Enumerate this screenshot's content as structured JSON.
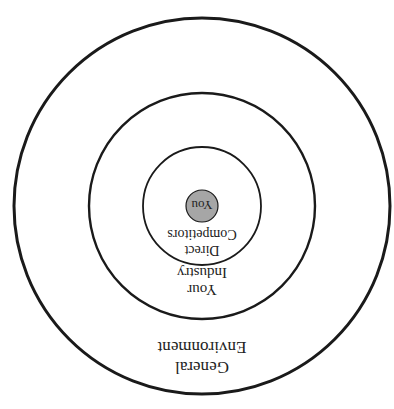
{
  "diagram": {
    "type": "concentric-circles",
    "orientation": "rotated-180",
    "rings": [
      {
        "id": "outer",
        "label_lines": [
          "General",
          "Environment"
        ]
      },
      {
        "id": "middle",
        "label_lines": [
          "Your",
          "Industry"
        ]
      },
      {
        "id": "inner",
        "label_lines": [
          "Direct",
          "Competitors"
        ]
      },
      {
        "id": "center",
        "label": "You",
        "fill": "#a6a6a6"
      }
    ],
    "stroke_color": "#1a1a1a"
  }
}
